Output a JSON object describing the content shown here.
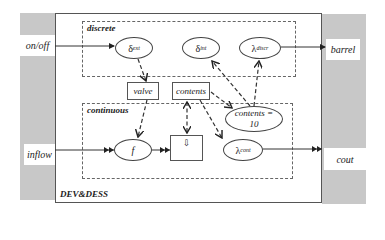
{
  "diagram": {
    "title": "DEV&DESS",
    "ports": {
      "inputs": [
        {
          "id": "on_off",
          "label": "on/off"
        },
        {
          "id": "inflow",
          "label": "inflow"
        }
      ],
      "outputs": [
        {
          "id": "barrel",
          "label": "barrel"
        },
        {
          "id": "cout",
          "label": "cout"
        }
      ]
    },
    "groups": {
      "discrete": {
        "label": "discrete",
        "nodes": [
          {
            "id": "delta_ext",
            "symbol": "δ",
            "sub": "ext"
          },
          {
            "id": "delta_int",
            "symbol": "δ",
            "sub": "int"
          },
          {
            "id": "lambda_discr",
            "symbol": "λ",
            "sup": "discr"
          }
        ]
      },
      "state": [
        {
          "id": "valve",
          "label": "valve"
        },
        {
          "id": "contents",
          "label": "contents"
        }
      ],
      "continuous": {
        "label": "continuous",
        "nodes": [
          {
            "id": "f",
            "label": "f"
          },
          {
            "id": "integrator",
            "label": "⇩"
          },
          {
            "id": "lambda_cont",
            "symbol": "λ",
            "sup": "cont"
          },
          {
            "id": "state_event",
            "label_line1": "contents =",
            "label_line2": "10"
          }
        ]
      }
    },
    "edges": [
      {
        "from": "on_off",
        "to": "delta_ext",
        "style": "solid"
      },
      {
        "from": "lambda_discr",
        "to": "barrel",
        "style": "solid"
      },
      {
        "from": "inflow",
        "to": "f",
        "style": "solid-double-arrow"
      },
      {
        "from": "f",
        "to": "integrator",
        "style": "solid-double-arrow"
      },
      {
        "from": "lambda_cont",
        "to": "cout",
        "style": "solid-double-arrow"
      },
      {
        "from": "delta_ext",
        "to": "valve",
        "style": "dashed"
      },
      {
        "from": "valve",
        "to": "f",
        "style": "dashed"
      },
      {
        "from": "contents",
        "to": "integrator",
        "style": "dashed-bidirectional"
      },
      {
        "from": "contents",
        "to": "lambda_cont",
        "style": "dashed"
      },
      {
        "from": "contents",
        "to": "state_event",
        "style": "dashed"
      },
      {
        "from": "state_event",
        "to": "delta_int",
        "style": "dashed"
      },
      {
        "from": "state_event",
        "to": "lambda_discr",
        "style": "dashed"
      }
    ],
    "colors": {
      "side_panel": "#c8c8c8",
      "line": "#333333",
      "background": "#ffffff"
    }
  }
}
